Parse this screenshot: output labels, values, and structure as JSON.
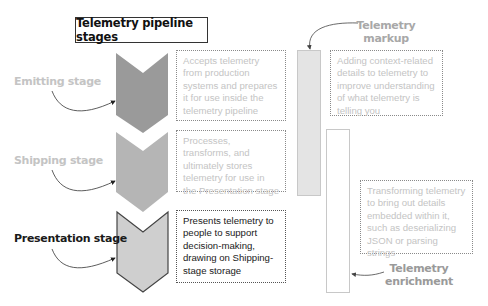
{
  "diagram": {
    "title": "Telemetry pipeline stages",
    "stages": [
      {
        "label": "Emitting stage",
        "description": "Accepts telemetry from production systems and prepares it for use inside the telemetry pipeline",
        "emphasis": "faded",
        "fill": "#9a9a9a"
      },
      {
        "label": "Shipping stage",
        "description": "Processes, transforms, and ultimately stores telemetry for use in the Presentation stage",
        "emphasis": "faded",
        "fill": "#b5b5b5"
      },
      {
        "label": "Presentation stage",
        "description": "Presents telemetry to people to support decision-making, drawing on Shipping-stage storage",
        "emphasis": "highlighted",
        "fill": "#cfcfcf"
      }
    ],
    "side_processes": [
      {
        "label_line1": "Telemetry",
        "label_line2": "markup",
        "description": "Adding context-related details to telemetry to improve understanding of what telemetry is telling you",
        "bar_fill": "#e4e4e4"
      },
      {
        "label_line1": "Telemetry",
        "label_line2": "enrichment",
        "description": "Transforming telemetry to bring out details embedded within it, such as deserializing JSON or parsing strings",
        "bar_fill": "#ffffff"
      }
    ]
  }
}
